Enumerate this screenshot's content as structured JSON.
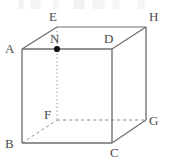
{
  "figure": {
    "kind": "geometry-diagram",
    "shape": "cube",
    "canvas": {
      "width": 169,
      "height": 164
    },
    "colors": {
      "background": "#ffffff",
      "solid_edge": "#6e6e6e",
      "hidden_edge": "#8c8c8c",
      "label_text": "#4a4a4a",
      "point_marker": "#111111"
    },
    "vertices": [
      {
        "id": "A",
        "label": "A",
        "x": 22,
        "y": 49,
        "label_x": 5,
        "label_y": 42,
        "hidden": false
      },
      {
        "id": "B",
        "label": "B",
        "x": 22,
        "y": 143,
        "label_x": 5,
        "label_y": 139,
        "hidden": false
      },
      {
        "id": "C",
        "label": "C",
        "x": 112,
        "y": 143,
        "label_x": 110,
        "label_y": 146,
        "hidden": false
      },
      {
        "id": "D",
        "label": "D",
        "x": 112,
        "y": 49,
        "label_x": 104,
        "label_y": 33,
        "hidden": false
      },
      {
        "id": "E",
        "label": "E",
        "x": 57,
        "y": 27,
        "label_x": 49,
        "label_y": 11,
        "hidden": false
      },
      {
        "id": "F",
        "label": "F",
        "x": 57,
        "y": 120,
        "label_x": 44,
        "label_y": 110,
        "hidden": true
      },
      {
        "id": "G",
        "label": "G",
        "x": 146,
        "y": 120,
        "label_x": 149,
        "label_y": 115,
        "hidden": false
      },
      {
        "id": "H",
        "label": "H",
        "x": 146,
        "y": 27,
        "label_x": 149,
        "label_y": 11,
        "hidden": false
      }
    ],
    "edges": [
      {
        "id": "AB",
        "from": "A",
        "to": "B",
        "style": "solid"
      },
      {
        "id": "BC",
        "from": "B",
        "to": "C",
        "style": "solid"
      },
      {
        "id": "CD",
        "from": "C",
        "to": "D",
        "style": "solid"
      },
      {
        "id": "DA",
        "from": "D",
        "to": "A",
        "style": "solid"
      },
      {
        "id": "EH",
        "from": "E",
        "to": "H",
        "style": "solid"
      },
      {
        "id": "HG",
        "from": "H",
        "to": "G",
        "style": "solid"
      },
      {
        "id": "AE",
        "from": "A",
        "to": "E",
        "style": "solid"
      },
      {
        "id": "DH",
        "from": "D",
        "to": "H",
        "style": "solid"
      },
      {
        "id": "CG",
        "from": "C",
        "to": "G",
        "style": "solid"
      },
      {
        "id": "EF",
        "from": "E",
        "to": "F",
        "style": "dotted"
      },
      {
        "id": "FG",
        "from": "F",
        "to": "G",
        "style": "dashed"
      },
      {
        "id": "BF",
        "from": "B",
        "to": "F",
        "style": "dashed"
      }
    ],
    "points": [
      {
        "id": "N",
        "label": "N",
        "x": 57,
        "y": 49,
        "label_x": 50,
        "label_y": 33,
        "on_edge": "DA",
        "marker": "filled-dot"
      }
    ]
  }
}
